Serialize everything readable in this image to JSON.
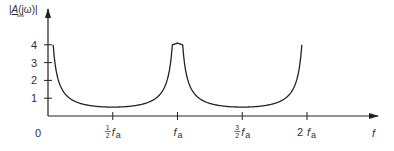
{
  "chart_data": {
    "type": "line",
    "title": "",
    "ylabel": "|A(jω)|",
    "ylabel_parts": {
      "open": "|",
      "symbol": "A",
      "paren": "(jω)",
      "close": "|"
    },
    "xlabel": "f",
    "origin_label": "0",
    "xlim": [
      0,
      2.2
    ],
    "ylim": [
      0,
      4.4
    ],
    "x_unit": "f_a",
    "x_ticks": [
      {
        "value": 0.5,
        "num": "1",
        "den": "2",
        "label": "f",
        "sub": "a"
      },
      {
        "value": 1.0,
        "num": "",
        "den": "",
        "label": "f",
        "sub": "a"
      },
      {
        "value": 1.5,
        "num": "3",
        "den": "2",
        "label": "f",
        "sub": "a"
      },
      {
        "value": 2.0,
        "num": "",
        "den": "",
        "prefix": "2",
        "label": "f",
        "sub": "a"
      }
    ],
    "y_ticks": [
      1,
      2,
      3,
      4
    ],
    "y_tick_labels": [
      "1",
      "2",
      "3",
      "4"
    ],
    "grid": false,
    "series": [
      {
        "name": "|A(jω)|",
        "description": "1 / (2·|sin(π f / f_a)|), clipped at 4",
        "x": [
          0.04,
          0.06,
          0.08,
          0.1,
          0.15,
          0.2,
          0.25,
          0.3,
          0.35,
          0.4,
          0.45,
          0.5,
          0.55,
          0.6,
          0.65,
          0.7,
          0.75,
          0.8,
          0.85,
          0.9,
          0.94,
          0.96,
          1.0,
          1.04,
          1.06,
          1.1,
          1.15,
          1.2,
          1.25,
          1.3,
          1.35,
          1.4,
          1.45,
          1.5,
          1.55,
          1.6,
          1.65,
          1.7,
          1.75,
          1.8,
          1.85,
          1.9,
          1.94,
          1.96
        ],
        "y": [
          4.0,
          2.67,
          2.01,
          1.62,
          1.1,
          0.85,
          0.71,
          0.62,
          0.56,
          0.53,
          0.51,
          0.5,
          0.51,
          0.53,
          0.56,
          0.62,
          0.71,
          0.85,
          1.1,
          1.62,
          2.67,
          4.0,
          4.0,
          4.0,
          2.67,
          1.62,
          1.1,
          0.85,
          0.71,
          0.62,
          0.56,
          0.53,
          0.51,
          0.5,
          0.51,
          0.53,
          0.56,
          0.62,
          0.71,
          0.85,
          1.1,
          1.62,
          2.67,
          4.0
        ]
      }
    ]
  }
}
